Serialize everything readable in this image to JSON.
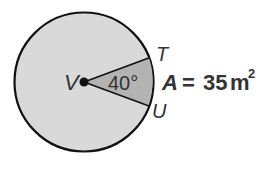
{
  "diagram": {
    "type": "circle-sector",
    "center_label": "V",
    "point_labels": [
      "T",
      "U"
    ],
    "angle_label": "40°",
    "area_label": {
      "variable": "A",
      "equals": "=",
      "value": "35",
      "unit": "m",
      "exponent": "2"
    },
    "colors": {
      "circle_fill": "#d9d9d9",
      "sector_fill": "#b3b3b3",
      "stroke": "#111111",
      "text": "#333333"
    }
  }
}
